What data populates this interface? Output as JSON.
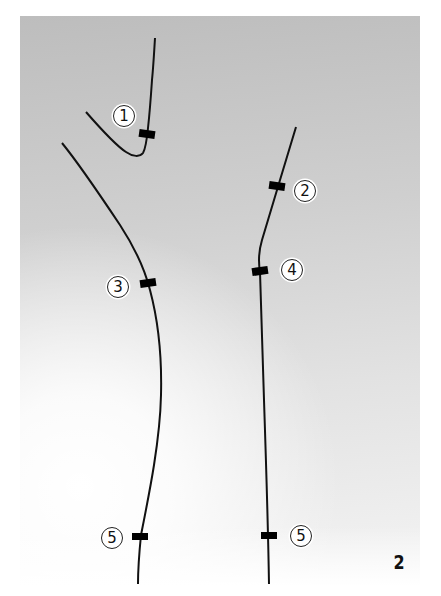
{
  "figure": {
    "number": "2",
    "background": {
      "top_color": "#bdbdbd",
      "bottom_color": "#ffffff"
    },
    "line_color": "#111111",
    "marker_color": "#000000"
  },
  "markers": [
    {
      "id": "1",
      "label": "①",
      "x": 147,
      "y": 134
    },
    {
      "id": "2",
      "label": "②",
      "x": 277,
      "y": 186
    },
    {
      "id": "3",
      "label": "③",
      "x": 148,
      "y": 283
    },
    {
      "id": "4",
      "label": "④",
      "x": 260,
      "y": 271
    },
    {
      "id": "5a",
      "label": "⑤",
      "x": 140,
      "y": 536
    },
    {
      "id": "5b",
      "label": "⑤",
      "x": 269,
      "y": 535
    }
  ],
  "labels": {
    "m1": "1",
    "m2": "2",
    "m3": "3",
    "m4": "4",
    "m5a": "5",
    "m5b": "5"
  }
}
